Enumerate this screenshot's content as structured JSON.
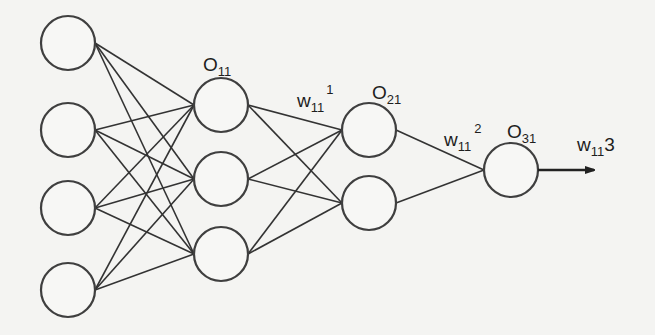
{
  "diagram": {
    "type": "feedforward-neural-network",
    "layers": [
      {
        "name": "input",
        "cx": 68,
        "nodes": [
          43,
          130,
          208,
          290
        ]
      },
      {
        "name": "hidden1",
        "cx": 221,
        "nodes": [
          105,
          179,
          254
        ]
      },
      {
        "name": "hidden2",
        "cx": 369,
        "nodes": [
          130,
          203
        ]
      },
      {
        "name": "output",
        "cx": 511,
        "nodes": [
          170
        ]
      }
    ],
    "node_radius": 27,
    "labels": {
      "o11": {
        "main": "O",
        "sub": "11"
      },
      "o21": {
        "main": "O",
        "sub": "21"
      },
      "o31": {
        "main": "O",
        "sub": "31"
      },
      "w1": {
        "main": "w",
        "sub": "11",
        "sup": "1"
      },
      "w2": {
        "main": "w",
        "sub": "11",
        "sup": "2"
      },
      "w3": {
        "main": "w",
        "sub": "11",
        "tail": "3"
      }
    },
    "colors": {
      "stroke": "#3f3f3f",
      "background": "#f4f4f2",
      "text": "#1e1e1e"
    }
  }
}
